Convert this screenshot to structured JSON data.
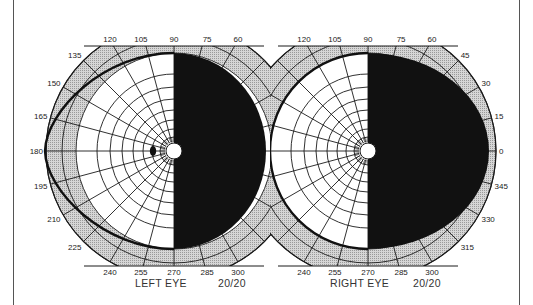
{
  "diagram": {
    "type": "visual-field-perimetry-chart",
    "colors": {
      "shaded_band": "#c8c8c8",
      "grid_line": "#1a1a1a",
      "scotoma_fill": "#111111",
      "isopter": "#111111",
      "background": "#ffffff"
    },
    "left_eye": {
      "caption": "LEFT EYE",
      "acuity": "20/20",
      "blind_spot": "present at ~15° temporal (180° meridian side)",
      "defect": "complete field loss of right half (hemianopia)",
      "angle_labels": [
        {
          "text": "120",
          "deg": 120
        },
        {
          "text": "105",
          "deg": 105
        },
        {
          "text": "90",
          "deg": 90
        },
        {
          "text": "75",
          "deg": 75
        },
        {
          "text": "60",
          "deg": 60
        },
        {
          "text": "135",
          "deg": 135
        },
        {
          "text": "150",
          "deg": 150
        },
        {
          "text": "165",
          "deg": 165
        },
        {
          "text": "180",
          "deg": 180
        },
        {
          "text": "195",
          "deg": 195
        },
        {
          "text": "210",
          "deg": 210
        },
        {
          "text": "225",
          "deg": 225
        },
        {
          "text": "240",
          "deg": 240
        },
        {
          "text": "255",
          "deg": 255
        },
        {
          "text": "270",
          "deg": 270
        },
        {
          "text": "285",
          "deg": 285
        },
        {
          "text": "300",
          "deg": 300
        }
      ]
    },
    "right_eye": {
      "caption": "RIGHT EYE",
      "acuity": "20/20",
      "defect": "complete field loss of right half (hemianopia)",
      "angle_labels": [
        {
          "text": "120",
          "deg": 120
        },
        {
          "text": "105",
          "deg": 105
        },
        {
          "text": "90",
          "deg": 90
        },
        {
          "text": "75",
          "deg": 75
        },
        {
          "text": "60",
          "deg": 60
        },
        {
          "text": "45",
          "deg": 45
        },
        {
          "text": "30",
          "deg": 30
        },
        {
          "text": "15",
          "deg": 15
        },
        {
          "text": "0",
          "deg": 0
        },
        {
          "text": "345",
          "deg": 345
        },
        {
          "text": "330",
          "deg": 330
        },
        {
          "text": "315",
          "deg": 315
        },
        {
          "text": "240",
          "deg": 240
        },
        {
          "text": "255",
          "deg": 255
        },
        {
          "text": "270",
          "deg": 270
        },
        {
          "text": "285",
          "deg": 285
        },
        {
          "text": "300",
          "deg": 300
        }
      ]
    }
  }
}
